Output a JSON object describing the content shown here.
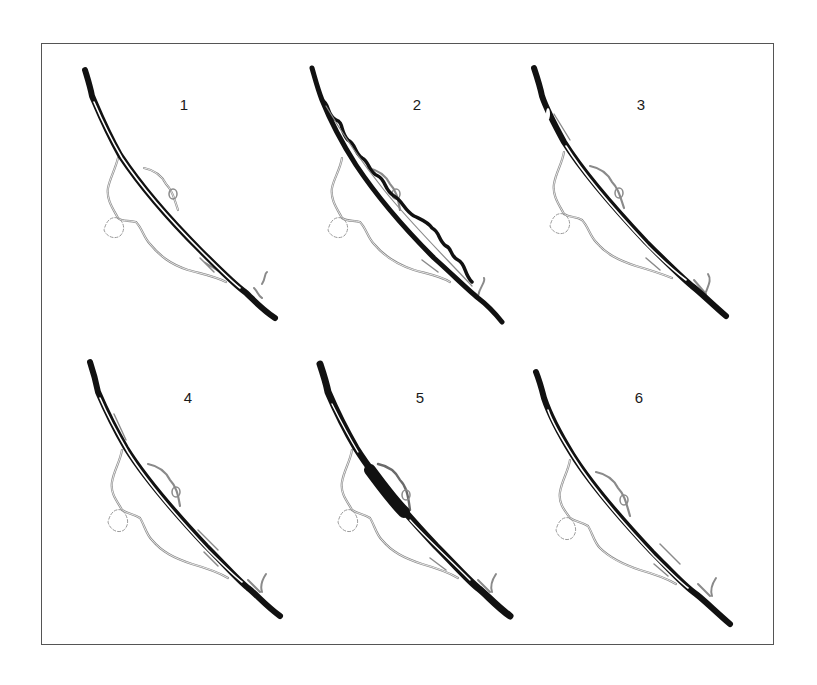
{
  "figure": {
    "panel_count": 6,
    "colors": {
      "main_channel": "#111111",
      "side_channel": "#8a8a8a",
      "pond_outline": "#9a9a9a",
      "frame": "#555555",
      "background": "#ffffff"
    }
  },
  "panels": [
    {
      "label": "1",
      "variant": "twin-channel",
      "left": 70,
      "top": 60
    },
    {
      "label": "2",
      "variant": "meandering-channel",
      "left": 300,
      "top": 60
    },
    {
      "label": "3",
      "variant": "single-channel-upper-split",
      "left": 530,
      "top": 60
    },
    {
      "label": "4",
      "variant": "twin-channel-with-side-arm",
      "left": 70,
      "top": 352
    },
    {
      "label": "5",
      "variant": "widened-middle-channel",
      "left": 300,
      "top": 352
    },
    {
      "label": "6",
      "variant": "twin-channel-narrow",
      "left": 530,
      "top": 352
    }
  ]
}
